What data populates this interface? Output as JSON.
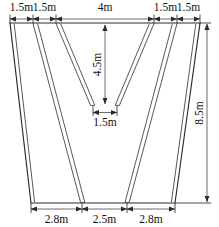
{
  "diagram": {
    "units": "m",
    "colors": {
      "background": "#ffffff",
      "outline": "#2b2b2b",
      "strip": "#3a3a3a",
      "dimension_line": "#5c5c5c",
      "text": "#111111"
    },
    "top_dimensions": [
      {
        "label": "1.5m",
        "value": 1.5
      },
      {
        "label": "1.5m",
        "value": 1.5
      },
      {
        "label": "4m",
        "value": 4
      },
      {
        "label": "1.5m",
        "value": 1.5
      },
      {
        "label": "1.5m",
        "value": 1.5
      }
    ],
    "bottom_dimensions": [
      {
        "label": "2.8m",
        "value": 2.8
      },
      {
        "label": "2.5m",
        "value": 2.5
      },
      {
        "label": "2.8m",
        "value": 2.8
      }
    ],
    "vertical_dimensions": [
      {
        "label": "4.5m",
        "value": 4.5,
        "position": "center",
        "orientation": "rotated"
      },
      {
        "label": "8.5m",
        "value": 8.5,
        "position": "right",
        "orientation": "rotated"
      }
    ],
    "inner_dimensions": [
      {
        "label": "1.5m",
        "value": 1.5,
        "position": "v-apex"
      }
    ]
  }
}
